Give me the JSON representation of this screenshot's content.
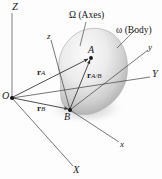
{
  "figure": {
    "background_color": "#fdfdfd",
    "line_color": "#3a3a3a",
    "text_color": "#1a1a1a",
    "body_fill_light": "#f2f2f2",
    "body_fill_mid": "#d8d8d8",
    "body_fill_dark": "#9c9c9c"
  },
  "annotations": {
    "omega_axes": "Ω (Axes)",
    "omega_body": "ω (Body)"
  },
  "axes": {
    "fixed": [
      {
        "name": "Z",
        "label": "Z"
      },
      {
        "name": "Y",
        "label": "Y"
      },
      {
        "name": "X",
        "label": "X"
      }
    ],
    "moving": [
      {
        "name": "z",
        "label": "z"
      },
      {
        "name": "y",
        "label": "y"
      },
      {
        "name": "x",
        "label": "x"
      }
    ]
  },
  "points": [
    {
      "name": "O",
      "label": "O"
    },
    {
      "name": "A",
      "label": "A"
    },
    {
      "name": "B",
      "label": "B"
    }
  ],
  "vectors": [
    {
      "name": "r_A",
      "symbol": "r",
      "subscript": "A"
    },
    {
      "name": "r_B",
      "symbol": "r",
      "subscript": "B"
    },
    {
      "name": "r_A/B",
      "symbol": "r",
      "subscript": "A/B"
    }
  ]
}
